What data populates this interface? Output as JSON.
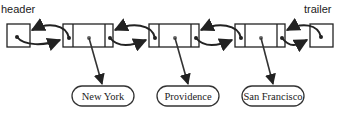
{
  "labels": {
    "header": "header",
    "trailer": "trailer"
  },
  "nodes": [
    {
      "element": "New York"
    },
    {
      "element": "Providence"
    },
    {
      "element": "San Francisco"
    }
  ],
  "colors": {
    "stroke": "#222222",
    "arrow": "#333333",
    "background": "#ffffff"
  }
}
